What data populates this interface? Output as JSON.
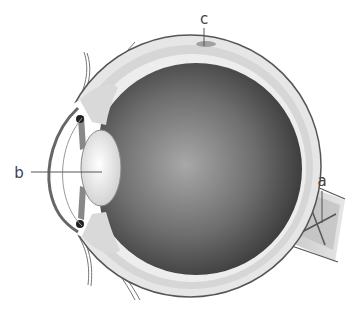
{
  "diagram": {
    "labels": [
      {
        "id": "a",
        "text": "a",
        "points_to": "optic nerve"
      },
      {
        "id": "b",
        "text": "b",
        "points_to": "lens"
      },
      {
        "id": "c",
        "text": "c",
        "points_to": "sclera/choroid layer at top"
      }
    ]
  },
  "colors": {
    "outline": "#555555",
    "sclera": "#e4e4e4",
    "vitreous_dark": "#3a3a3a",
    "vitreous_light": "#9a9a9a",
    "lens": "#f2f2f2",
    "label": "#444444",
    "leader": "#555555"
  }
}
